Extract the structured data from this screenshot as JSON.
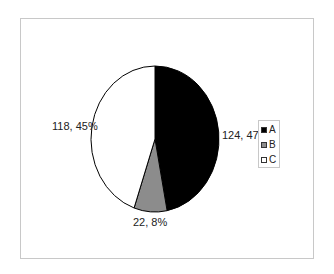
{
  "chart_data": {
    "type": "pie",
    "title": "",
    "categories": [
      "A",
      "B",
      "C"
    ],
    "values": [
      124,
      22,
      118
    ],
    "percentages": [
      47,
      8,
      45
    ],
    "data_labels": [
      "124, 47%",
      "22, 8%",
      "118, 45%"
    ],
    "colors": [
      "#000000",
      "#8c8c8c",
      "#ffffff"
    ],
    "legend": {
      "position": "right",
      "entries": [
        "A",
        "B",
        "C"
      ]
    }
  },
  "labels": {
    "a": "124, 47%",
    "b": "22, 8%",
    "c": "118, 45%"
  },
  "legend": {
    "items": [
      {
        "label": "A",
        "color": "#000000"
      },
      {
        "label": "B",
        "color": "#8c8c8c"
      },
      {
        "label": "C",
        "color": "#ffffff"
      }
    ]
  }
}
